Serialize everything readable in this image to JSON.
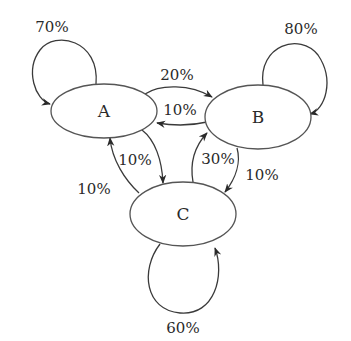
{
  "diagram": {
    "type": "state-transition-graph",
    "nodes": [
      {
        "id": "A",
        "label": "A",
        "cx": 104,
        "cy": 111,
        "rx": 53,
        "ry": 27
      },
      {
        "id": "B",
        "label": "B",
        "cx": 258,
        "cy": 117,
        "rx": 53,
        "ry": 32
      },
      {
        "id": "C",
        "label": "C",
        "cx": 183,
        "cy": 214,
        "rx": 53,
        "ry": 32
      }
    ],
    "edges": [
      {
        "from": "A",
        "to": "A",
        "label": "70%"
      },
      {
        "from": "B",
        "to": "B",
        "label": "80%"
      },
      {
        "from": "C",
        "to": "C",
        "label": "60%"
      },
      {
        "from": "A",
        "to": "B",
        "label": "20%"
      },
      {
        "from": "B",
        "to": "A",
        "label": "10%"
      },
      {
        "from": "A",
        "to": "C",
        "label": "10%"
      },
      {
        "from": "C",
        "to": "A",
        "label": "10%"
      },
      {
        "from": "C",
        "to": "B",
        "label": "30%"
      },
      {
        "from": "B",
        "to": "C",
        "label": "10%"
      }
    ],
    "colors": {
      "stroke": "#3a3a3a",
      "node_stroke": "#555555",
      "background": "#ffffff"
    }
  }
}
